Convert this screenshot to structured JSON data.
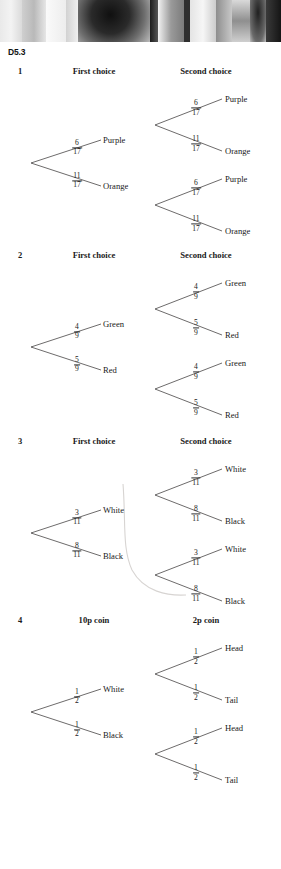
{
  "page": {
    "section_label": "D5.3",
    "photo_alt": "photo-strip"
  },
  "exercises": [
    {
      "number": "1",
      "headers": {
        "first": "First choice",
        "second": "Second choice"
      },
      "first_stage": [
        {
          "fraction": {
            "num": "6",
            "den": "17"
          },
          "outcome": "Purple"
        },
        {
          "fraction": {
            "num": "11",
            "den": "17"
          },
          "outcome": "Orange"
        }
      ],
      "second_stage": [
        {
          "fraction": {
            "num": "6",
            "den": "17"
          },
          "outcome": "Purple"
        },
        {
          "fraction": {
            "num": "11",
            "den": "17"
          },
          "outcome": "Orange"
        },
        {
          "fraction": {
            "num": "6",
            "den": "17"
          },
          "outcome": "Purple"
        },
        {
          "fraction": {
            "num": "11",
            "den": "17"
          },
          "outcome": "Orange"
        }
      ]
    },
    {
      "number": "2",
      "headers": {
        "first": "First choice",
        "second": "Second choice"
      },
      "first_stage": [
        {
          "fraction": {
            "num": "4",
            "den": "9"
          },
          "outcome": "Green"
        },
        {
          "fraction": {
            "num": "5",
            "den": "9"
          },
          "outcome": "Red"
        }
      ],
      "second_stage": [
        {
          "fraction": {
            "num": "4",
            "den": "9"
          },
          "outcome": "Green"
        },
        {
          "fraction": {
            "num": "5",
            "den": "9"
          },
          "outcome": "Red"
        },
        {
          "fraction": {
            "num": "4",
            "den": "9"
          },
          "outcome": "Green"
        },
        {
          "fraction": {
            "num": "5",
            "den": "9"
          },
          "outcome": "Red"
        }
      ]
    },
    {
      "number": "3",
      "headers": {
        "first": "First choice",
        "second": "Second choice"
      },
      "first_stage": [
        {
          "fraction": {
            "num": "3",
            "den": "11"
          },
          "outcome": "White"
        },
        {
          "fraction": {
            "num": "8",
            "den": "11"
          },
          "outcome": "Black"
        }
      ],
      "second_stage": [
        {
          "fraction": {
            "num": "3",
            "den": "11"
          },
          "outcome": "White"
        },
        {
          "fraction": {
            "num": "8",
            "den": "11"
          },
          "outcome": "Black"
        },
        {
          "fraction": {
            "num": "3",
            "den": "11"
          },
          "outcome": "White"
        },
        {
          "fraction": {
            "num": "8",
            "den": "11"
          },
          "outcome": "Black"
        }
      ]
    },
    {
      "number": "4",
      "headers": {
        "first": "10p coin",
        "second": "2p coin"
      },
      "first_stage": [
        {
          "fraction": {
            "num": "1",
            "den": "2"
          },
          "outcome": "White"
        },
        {
          "fraction": {
            "num": "1",
            "den": "2"
          },
          "outcome": "Black"
        }
      ],
      "second_stage": [
        {
          "fraction": {
            "num": "1",
            "den": "2"
          },
          "outcome": "Head"
        },
        {
          "fraction": {
            "num": "1",
            "den": "2"
          },
          "outcome": "Tail"
        },
        {
          "fraction": {
            "num": "1",
            "den": "2"
          },
          "outcome": "Head"
        },
        {
          "fraction": {
            "num": "1",
            "den": "2"
          },
          "outcome": "Tail"
        }
      ]
    }
  ],
  "colors": {
    "page_background": "#ffffff",
    "ink": "#1a1a1a",
    "rule": "#3c3a3a",
    "artifact": "#d7d4d2"
  }
}
